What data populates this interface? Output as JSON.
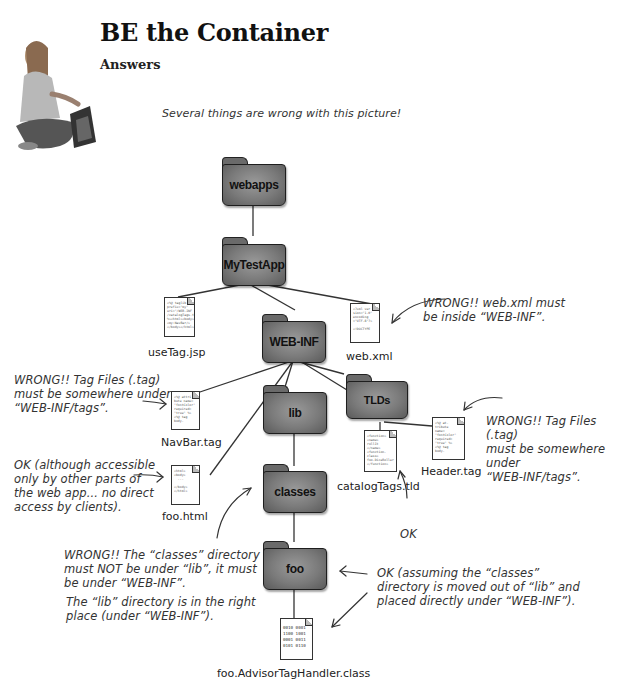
{
  "header": {
    "title": "BE the Container",
    "subtitle": "Answers",
    "intro": "Several things are wrong with this picture!"
  },
  "folders": {
    "webapps": "webapps",
    "mytestapp": "MyTestApp",
    "webinf": "WEB-INF",
    "lib": "lib",
    "tlds": "TLDs",
    "classes": "classes",
    "foo": "foo"
  },
  "files": {
    "usetag": {
      "name": "useTag.jsp",
      "content": "<%@ taglib\nprefix=\"my\"\nuri=\"/WEB-INF\n/catalogTags.tld\"\n%><html><body>\n<my:NavBar/>\n</body></html>"
    },
    "webxml": {
      "name": "web.xml",
      "content": "<?xml ver\nsion=\"1.0\"\nencoding\n=\"UTF-8\"?>\n\n<!DOCTYPE"
    },
    "navbar": {
      "name": "NavBar.tag",
      "content": "<%@ attri\nbute name=\n\"fontColor\"\nrequired=\n\"true\" %>\n<%@ tag\nbody-"
    },
    "foohtml": {
      "name": "foo.html",
      "content": "<html>\n<body>\n  ...\n\n</body>\n</html>"
    },
    "catalog": {
      "name": "catalogTags.tld",
      "content": "<function>\n<name>\nrollIt\n</name>\n<function-\nclass>\nfoo.DiceRoller\n</function>"
    },
    "header": {
      "name": "Header.tag",
      "content": "<%@ at-\ntribute\nname=\n\"fontColor\"\nrequired=\n\"true\" %>\n<%@ tag\nbody-"
    },
    "handler": {
      "name": "foo.AdvisorTagHandler.class",
      "content": "0010 0001\n1100 1001\n0001 0011\n0101 0110"
    }
  },
  "annotations": {
    "webxml_wrong": [
      "WRONG!! web.xml must",
      "be inside “WEB-INF”."
    ],
    "navbar_wrong": [
      "WRONG!! Tag Files (.tag)",
      "must be somewhere under",
      "“WEB-INF/tags”."
    ],
    "header_wrong": [
      "WRONG!! Tag Files (.tag)",
      "must be somewhere under",
      "“WEB-INF/tags”."
    ],
    "foohtml_ok": [
      "OK (although accessible",
      "only by other parts of",
      "the web app... no direct",
      "access by clients)."
    ],
    "catalog_ok": "OK",
    "classes_wrong": [
      "WRONG!! The “classes” directory",
      "must NOT be under “lib”, it must",
      "be under “WEB-INF”."
    ],
    "lib_ok": [
      "The “lib” directory is in the right",
      "place (under “WEB-INF”)."
    ],
    "foo_ok": [
      "OK (assuming the “classes”",
      "directory is moved out of “lib” and",
      "placed directly under “WEB-INF”)."
    ]
  },
  "colors": {
    "folder_fill": "#7a7a7a",
    "folder_border": "#1e1e1e",
    "line": "#333333",
    "text": "#222222"
  }
}
